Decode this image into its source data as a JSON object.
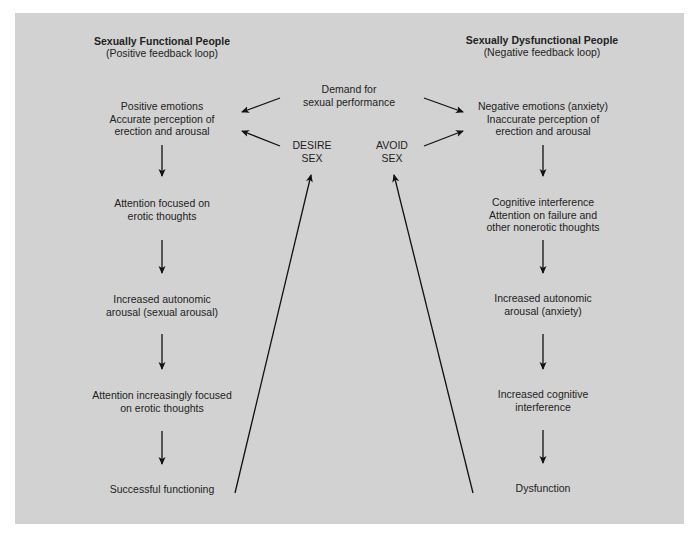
{
  "diagram": {
    "background_color": "#d2d2d2",
    "center": {
      "demand": [
        "Demand for",
        "sexual performance"
      ],
      "desire": [
        "DESIRE",
        "SEX"
      ],
      "avoid": [
        "AVOID",
        "SEX"
      ]
    },
    "left_column": {
      "title": "Sexually Functional People",
      "subtitle": "(Positive feedback loop)",
      "steps": [
        [
          "Positive emotions",
          "Accurate perception of",
          "erection and arousal"
        ],
        [
          "Attention focused on",
          "erotic thoughts"
        ],
        [
          "Increased autonomic",
          "arousal (sexual arousal)"
        ],
        [
          "Attention increasingly focused",
          "on erotic thoughts"
        ],
        [
          "Successful functioning"
        ]
      ]
    },
    "right_column": {
      "title": "Sexually Dysfunctional People",
      "subtitle": "(Negative feedback loop)",
      "steps": [
        [
          "Negative emotions (anxiety)",
          "Inaccurate perception of",
          "erection and arousal"
        ],
        [
          "Cognitive interference",
          "Attention on failure and",
          "other nonerotic thoughts"
        ],
        [
          "Increased autonomic",
          "arousal (anxiety)"
        ],
        [
          "Increased cognitive",
          "interference"
        ],
        [
          "Dysfunction"
        ]
      ]
    }
  }
}
